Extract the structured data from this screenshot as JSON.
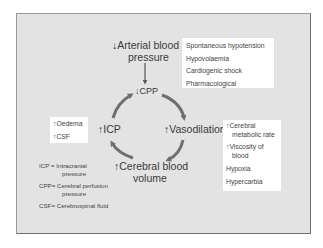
{
  "diagram": {
    "title_node": {
      "prefix": "↓",
      "line1": "Arterial blood",
      "line2": "pressure"
    },
    "cycle_nodes": {
      "cpp": {
        "prefix": "↓",
        "label": "CPP"
      },
      "vasodilation": {
        "prefix": "↑",
        "label": "Vasodilation"
      },
      "cerebral_blood_volume": {
        "prefix": "↑",
        "line1": "Cerebral blood",
        "line2": "volume"
      },
      "icp": {
        "prefix": "↑",
        "label": "ICP"
      }
    },
    "cycle_order": [
      "↓ CPP",
      "↑ Vasodilation",
      "↑ Cerebral blood volume",
      "↑ ICP"
    ],
    "causes_of_low_bp": [
      "Spontaneous hypotension",
      "Hypovolaemia",
      "Cardiogenic shock",
      "Pharmacological"
    ],
    "causes_of_vasodilation": [
      {
        "line1": "↑Cerebral",
        "line2": "metabolic rate"
      },
      {
        "line1": "↑Viscosity of",
        "line2": "blood"
      },
      {
        "line1": "Hypoxia"
      },
      {
        "line1": "Hypercarbia"
      }
    ],
    "causes_of_icp": [
      "↑Oedema",
      "↑CSF"
    ],
    "legend": [
      {
        "abbr": "ICP = Intracranial",
        "cont": "pressure"
      },
      {
        "abbr": "CPP= Cerebral perfusion",
        "cont": "pressure"
      },
      {
        "abbr": "CSF= Cerebrospinal fluid"
      }
    ],
    "colors": {
      "background": "#e3e3e3",
      "box": "#ffffff",
      "arrow": "#6f6f6f",
      "text": "#3a3a3a"
    }
  }
}
